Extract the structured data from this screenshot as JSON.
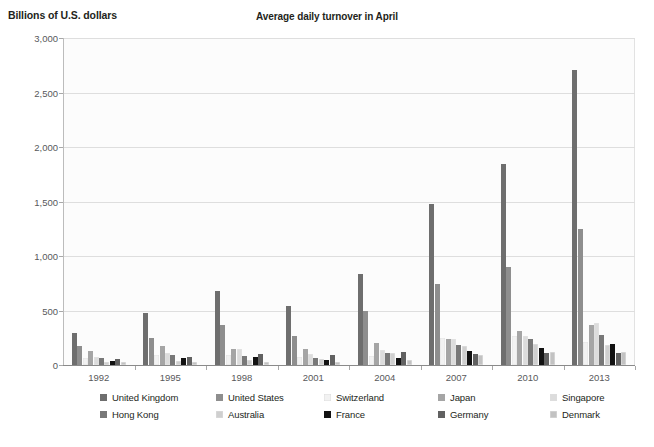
{
  "chart_data": {
    "type": "bar",
    "title": "Average daily turnover in April",
    "ylabel": "Billions of U.S. dollars",
    "xlabel": "",
    "ylim": [
      0,
      3000
    ],
    "ytick_labels": [
      "0",
      "500",
      "1,000",
      "1,500",
      "2,000",
      "2,500",
      "3,000"
    ],
    "ytick_values": [
      0,
      500,
      1000,
      1500,
      2000,
      2500,
      3000
    ],
    "grid": true,
    "legend_position": "bottom",
    "categories": [
      "1992",
      "1995",
      "1998",
      "2001",
      "2004",
      "2007",
      "2010",
      "2013"
    ],
    "series": [
      {
        "name": "United Kingdom",
        "color": "#6e6e6e",
        "values": [
          290,
          475,
          680,
          540,
          835,
          1475,
          1845,
          2705
        ]
      },
      {
        "name": "United States",
        "color": "#8e8e8e",
        "values": [
          170,
          245,
          370,
          265,
          495,
          745,
          900,
          1250
        ]
      },
      {
        "name": "Switzerland",
        "color": "#f2f2f2",
        "values": [
          65,
          88,
          92,
          75,
          85,
          250,
          270,
          215
        ]
      },
      {
        "name": "Japan",
        "color": "#a5a5a5",
        "values": [
          125,
          170,
          145,
          150,
          205,
          240,
          310,
          370
        ]
      },
      {
        "name": "Singapore",
        "color": "#dcdcdc",
        "values": [
          76,
          107,
          145,
          104,
          134,
          240,
          265,
          385
        ]
      },
      {
        "name": "Hong Kong",
        "color": "#787878",
        "values": [
          61,
          91,
          80,
          68,
          106,
          181,
          238,
          275
        ]
      },
      {
        "name": "Australia",
        "color": "#cfcfcf",
        "values": [
          30,
          40,
          48,
          54,
          107,
          176,
          192,
          182
        ]
      },
      {
        "name": "France",
        "color": "#121212",
        "values": [
          34,
          61,
          77,
          50,
          67,
          127,
          152,
          190
        ]
      },
      {
        "name": "Germany",
        "color": "#616161",
        "values": [
          57,
          77,
          100,
          91,
          120,
          101,
          109,
          111
        ]
      },
      {
        "name": "Denmark",
        "color": "#c2c2c2",
        "values": [
          27,
          31,
          28,
          24,
          42,
          88,
          120,
          117
        ]
      }
    ]
  },
  "legend": {
    "items": [
      {
        "label": "United Kingdom"
      },
      {
        "label": "United States"
      },
      {
        "label": "Switzerland"
      },
      {
        "label": "Japan"
      },
      {
        "label": "Singapore"
      },
      {
        "label": "Hong Kong"
      },
      {
        "label": "Australia"
      },
      {
        "label": "France"
      },
      {
        "label": "Germany"
      },
      {
        "label": "Denmark"
      }
    ]
  }
}
